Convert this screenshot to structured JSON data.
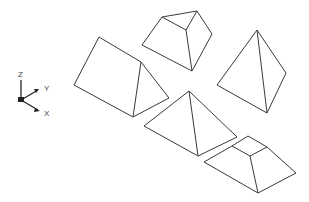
{
  "axis_icon": {
    "labels": {
      "z": "Z",
      "y": "Y",
      "x": "X"
    }
  },
  "shapes": [
    {
      "name": "wedge",
      "type": "triangular-prism"
    },
    {
      "name": "top-frustum",
      "type": "pyramid-frustum"
    },
    {
      "name": "right-pyramid",
      "type": "pyramid"
    },
    {
      "name": "middle-pyramid",
      "type": "pyramid"
    },
    {
      "name": "bottom-frustum",
      "type": "pyramid-frustum"
    }
  ],
  "colors": {
    "line": "#3a3a3a",
    "background": "#ffffff"
  }
}
